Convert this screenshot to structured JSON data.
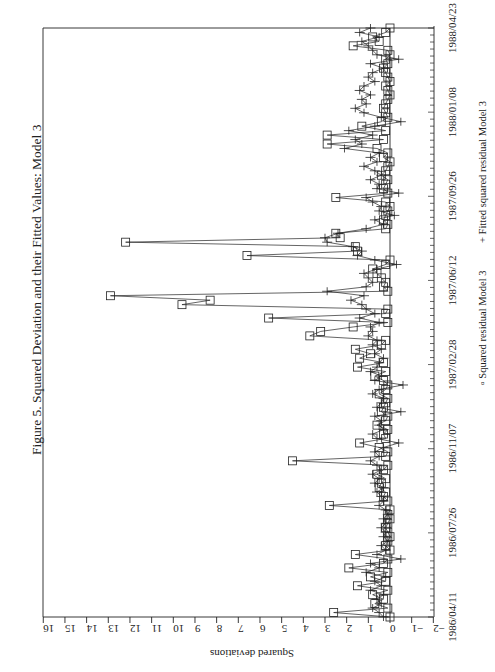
{
  "chart_data": {
    "type": "line",
    "title": "Figure 5.  Squared Deviation and their Fitted Values: Model 3",
    "xlabel": "",
    "ylabel": "Squared deviations",
    "orientation_note": "page rotated 180 degrees; value axis along bottom, date axis along right",
    "ylim": [
      -2,
      16
    ],
    "value_ticks": [
      "16",
      "15",
      "14",
      "13",
      "12",
      "11",
      "10",
      "9",
      "8",
      "7",
      "6",
      "5",
      "4",
      "3",
      "2",
      "1",
      "0",
      "-1",
      "-2"
    ],
    "date_ticks": [
      "1986/04/11",
      "1986/07/26",
      "1986/11/07",
      "1987/02/28",
      "1987/06/12",
      "1987/09/26",
      "1988/01/08",
      "1988/04/23"
    ],
    "grid": false,
    "legend": [
      {
        "marker": "square",
        "label": "Squared residual Model 3"
      },
      {
        "marker": "plus",
        "label": "Fitted squared residual Model 3"
      }
    ],
    "series": [
      {
        "name": "Squared residual Model 3",
        "marker": "square",
        "values": [
          0.0,
          2.6,
          0.1,
          0.7,
          0.3,
          0.8,
          0.1,
          1.5,
          0.2,
          0.9,
          0.1,
          1.9,
          0.3,
          0.1,
          1.6,
          0.0,
          0.2,
          0.1,
          0.0,
          0.1,
          0.2,
          0.1,
          0.0,
          0.1,
          0.0,
          2.8,
          0.1,
          0.3,
          0.2,
          0.5,
          0.4,
          0.2,
          0.6,
          0.3,
          0.1,
          4.5,
          0.2,
          0.1,
          0.5,
          1.4,
          0.2,
          0.3,
          0.1,
          0.6,
          0.2,
          0.1,
          0.4,
          0.3,
          0.2,
          0.1,
          0.5,
          0.2,
          0.1,
          0.3,
          0.7,
          0.2,
          1.5,
          0.3,
          1.4,
          0.9,
          1.6,
          0.4,
          0.2,
          3.7,
          3.2,
          1.7,
          0.1,
          5.6,
          0.2,
          0.1,
          9.6,
          8.3,
          12.9,
          0.1,
          0.3,
          0.2,
          0.4,
          0.6,
          0.8,
          0.2,
          0.0,
          6.6,
          1.5,
          1.6,
          12.2,
          2.3,
          2.5,
          0.2,
          0.1,
          0.3,
          0.2,
          0.1,
          0.0,
          0.2,
          2.5,
          0.1,
          0.3,
          0.2,
          0.1,
          0.4,
          0.2,
          0.1,
          0.0,
          0.3,
          0.1,
          0.6,
          2.9,
          0.3,
          2.9,
          0.2,
          1.3,
          0.4,
          0.1,
          0.2,
          0.3,
          0.2,
          0.1,
          0.0,
          0.1,
          0.2,
          0.0,
          0.1,
          0.2,
          0.3,
          0.1,
          0.2,
          0.0,
          0.1,
          1.7,
          0.5,
          0.8,
          0.2,
          0.0
        ]
      },
      {
        "name": "Fitted squared residual Model 3",
        "marker": "plus",
        "values": [
          0.3,
          0.5,
          0.8,
          0.4,
          0.6,
          0.3,
          0.9,
          0.4,
          0.7,
          0.2,
          1.1,
          0.5,
          0.9,
          -0.5,
          0.6,
          0.2,
          0.4,
          0.1,
          0.3,
          0.2,
          0.4,
          0.2,
          0.3,
          0.1,
          0.2,
          0.5,
          0.3,
          0.4,
          0.6,
          0.3,
          0.7,
          0.5,
          0.8,
          0.4,
          0.6,
          0.9,
          0.5,
          0.7,
          0.3,
          -0.4,
          0.6,
          0.8,
          0.3,
          0.5,
          0.4,
          0.7,
          -0.5,
          0.6,
          0.4,
          0.3,
          0.8,
          0.5,
          -0.6,
          0.7,
          0.4,
          0.9,
          0.6,
          0.5,
          0.3,
          0.7,
          0.4,
          0.8,
          0.6,
          1.0,
          0.8,
          0.9,
          0.5,
          1.4,
          0.7,
          1.1,
          1.3,
          1.8,
          1.2,
          2.9,
          1.1,
          0.8,
          1.0,
          1.2,
          0.6,
          -0.3,
          0.7,
          1.5,
          1.3,
          1.7,
          2.9,
          3.0,
          2.4,
          1.1,
          0.3,
          0.7,
          -0.2,
          0.5,
          0.4,
          0.8,
          1.1,
          -0.4,
          0.6,
          0.5,
          0.9,
          0.4,
          0.7,
          1.2,
          0.6,
          0.9,
          0.5,
          2.1,
          1.3,
          1.6,
          0.8,
          1.9,
          0.7,
          -0.5,
          0.4,
          1.2,
          1.6,
          1.1,
          1.3,
          0.9,
          1.4,
          1.2,
          0.7,
          1.0,
          0.8,
          0.3,
          0.9,
          -0.4,
          0.6,
          0.8,
          1.0,
          1.3,
          0.5,
          1.4,
          0.9
        ]
      }
    ]
  },
  "layout": {
    "zero_x": 390,
    "px_per_unit": 21.67,
    "plot_top": 28,
    "plot_bottom": 617,
    "plot_left": 43,
    "date_axis_x": 434
  }
}
